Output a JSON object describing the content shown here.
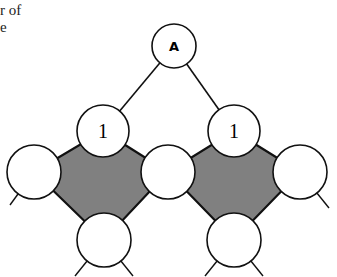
{
  "caption": {
    "line1": "r of",
    "line2": "e"
  },
  "diagram": {
    "root_label": "A",
    "level1_labels": [
      "1",
      "1"
    ],
    "fill_color": "#808080",
    "stroke_color": "#111111"
  }
}
